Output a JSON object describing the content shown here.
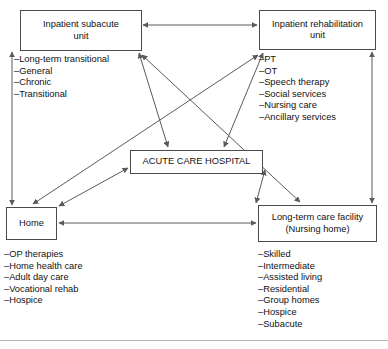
{
  "diagram": {
    "line_color": "#5a5a5a",
    "box_border_color": "#4a4a4a",
    "background": "#ffffff",
    "nodes": [
      {
        "id": "subacute",
        "label": "Inpatient subacute\nunit",
        "label_line1": "Inpatient subacute",
        "label_line2": "unit",
        "items": [
          "–Long-term transitional",
          "–General",
          "–Chronic",
          "–Transitional"
        ]
      },
      {
        "id": "rehab",
        "label": "Inpatient rehabilitation\nunit",
        "label_line1": "Inpatient rehabilitation",
        "label_line2": "unit",
        "items": [
          "–PT",
          "–OT",
          "–Speech therapy",
          "–Social services",
          "–Nursing care",
          "–Ancillary services"
        ]
      },
      {
        "id": "acute",
        "label": "ACUTE CARE HOSPITAL",
        "label_line1": "ACUTE CARE HOSPITAL",
        "label_line2": "",
        "items": []
      },
      {
        "id": "home",
        "label": "Home",
        "label_line1": "Home",
        "label_line2": "",
        "items": [
          "–OP therapies",
          "–Home health care",
          "–Adult day care",
          "–Vocational rehab",
          "–Hospice"
        ]
      },
      {
        "id": "ltc",
        "label": "Long-term care facility\n(Nursing home)",
        "label_line1": "Long-term care facility",
        "label_line2": "(Nursing home)",
        "items": [
          "–Skilled",
          "–Intermediate",
          "–Assisted living",
          "–Residential",
          "–Group homes",
          "–Hospice",
          "–Subacute"
        ]
      }
    ],
    "edges": [
      {
        "from": "subacute",
        "to": "rehab",
        "direction": "both"
      },
      {
        "from": "subacute",
        "to": "home",
        "direction": "both"
      },
      {
        "from": "rehab",
        "to": "ltc",
        "direction": "both"
      },
      {
        "from": "home",
        "to": "ltc",
        "direction": "both"
      },
      {
        "from": "subacute",
        "to": "acute",
        "direction": "both"
      },
      {
        "from": "rehab",
        "to": "acute",
        "direction": "both"
      },
      {
        "from": "home",
        "to": "acute",
        "direction": "both"
      },
      {
        "from": "ltc",
        "to": "acute",
        "direction": "both"
      },
      {
        "from": "subacute",
        "to": "ltc",
        "direction": "both"
      },
      {
        "from": "rehab",
        "to": "home",
        "direction": "both"
      }
    ]
  }
}
